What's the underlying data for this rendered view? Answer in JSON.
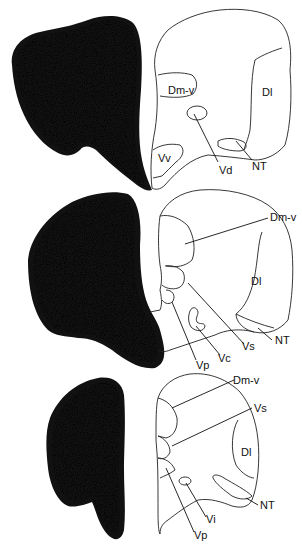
{
  "figure": {
    "panels": [
      {
        "id": "top",
        "labels": [
          {
            "key": "Dm-v",
            "text": "Dm-v"
          },
          {
            "key": "Dl",
            "text": "Dl"
          },
          {
            "key": "Vv",
            "text": "Vv"
          },
          {
            "key": "Vd",
            "text": "Vd"
          },
          {
            "key": "NT",
            "text": "NT"
          }
        ]
      },
      {
        "id": "middle",
        "labels": [
          {
            "key": "Dm-v",
            "text": "Dm-v"
          },
          {
            "key": "Dl",
            "text": "Dl"
          },
          {
            "key": "NT",
            "text": "NT"
          },
          {
            "key": "Vs",
            "text": "Vs"
          },
          {
            "key": "Vc",
            "text": "Vc"
          },
          {
            "key": "Vp",
            "text": "Vp"
          }
        ]
      },
      {
        "id": "bottom",
        "labels": [
          {
            "key": "Dm-v",
            "text": "Dm-v"
          },
          {
            "key": "Vs",
            "text": "Vs"
          },
          {
            "key": "Dl",
            "text": "Dl"
          },
          {
            "key": "Vi",
            "text": "Vi"
          },
          {
            "key": "NT",
            "text": "NT"
          },
          {
            "key": "Vp",
            "text": "Vp"
          }
        ]
      }
    ]
  }
}
